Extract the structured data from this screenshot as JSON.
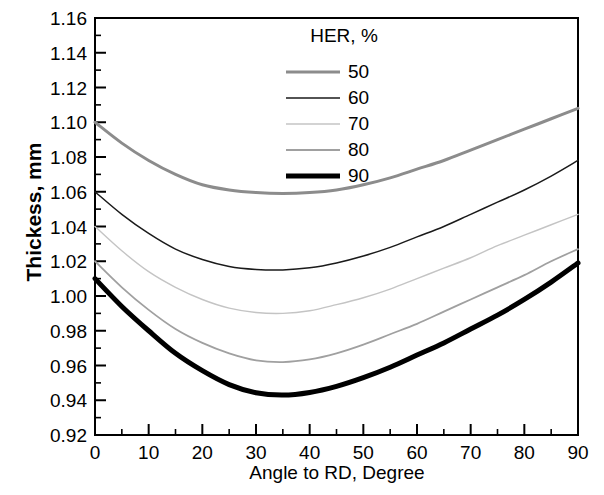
{
  "chart_data": {
    "type": "line",
    "title": "",
    "xlabel": "Angle to RD, Degree",
    "ylabel": "Thickess, mm",
    "xlim": [
      0,
      90
    ],
    "ylim": [
      0.92,
      1.16
    ],
    "xticks": [
      0,
      10,
      20,
      30,
      40,
      50,
      60,
      70,
      80,
      90
    ],
    "xtick_labels": [
      "0",
      "10",
      "20",
      "30",
      "40",
      "50",
      "60",
      "70",
      "80",
      "90"
    ],
    "xminor_step": 5,
    "yticks": [
      0.92,
      0.94,
      0.96,
      0.98,
      1.0,
      1.02,
      1.04,
      1.06,
      1.08,
      1.1,
      1.12,
      1.14,
      1.16
    ],
    "ytick_labels": [
      "0.92",
      "0.94",
      "0.96",
      "0.98",
      "1.00",
      "1.02",
      "1.04",
      "1.06",
      "1.08",
      "1.10",
      "1.12",
      "1.14",
      "1.16"
    ],
    "yminor_step": 0.01,
    "grid": false,
    "legend": {
      "title": "HER, %",
      "position": "top-center-right",
      "entries": [
        {
          "label": "50",
          "color": "#8c8c8c",
          "width": 3.0
        },
        {
          "label": "60",
          "color": "#1a1a1a",
          "width": 1.5
        },
        {
          "label": "70",
          "color": "#c4c4c4",
          "width": 1.4
        },
        {
          "label": "80",
          "color": "#a0a0a0",
          "width": 1.8
        },
        {
          "label": "90",
          "color": "#000000",
          "width": 5.0
        }
      ]
    },
    "x": [
      0,
      5,
      10,
      15,
      20,
      25,
      30,
      35,
      40,
      45,
      50,
      55,
      60,
      65,
      70,
      75,
      80,
      85,
      90
    ],
    "series": [
      {
        "name": "50",
        "color": "#8c8c8c",
        "width": 3.0,
        "min_value": 1.059,
        "min_at": 34,
        "values": [
          1.1,
          1.088,
          1.078,
          1.07,
          1.064,
          1.061,
          1.0595,
          1.059,
          1.0595,
          1.061,
          1.064,
          1.068,
          1.073,
          1.078,
          1.084,
          1.09,
          1.096,
          1.102,
          1.108
        ]
      },
      {
        "name": "60",
        "color": "#1a1a1a",
        "width": 1.5,
        "min_value": 1.015,
        "min_at": 33,
        "values": [
          1.06,
          1.047,
          1.036,
          1.027,
          1.021,
          1.017,
          1.0153,
          1.015,
          1.0162,
          1.019,
          1.023,
          1.028,
          1.034,
          1.04,
          1.047,
          1.054,
          1.061,
          1.069,
          1.078
        ]
      },
      {
        "name": "70",
        "color": "#c4c4c4",
        "width": 1.4,
        "min_value": 0.99,
        "min_at": 32,
        "values": [
          1.04,
          1.026,
          1.014,
          1.005,
          0.998,
          0.993,
          0.9905,
          0.99,
          0.9915,
          0.995,
          0.999,
          1.004,
          1.01,
          1.016,
          1.022,
          1.029,
          1.035,
          1.041,
          1.047
        ]
      },
      {
        "name": "80",
        "color": "#a0a0a0",
        "width": 1.8,
        "min_value": 0.962,
        "min_at": 31,
        "values": [
          1.02,
          1.005,
          0.992,
          0.981,
          0.973,
          0.967,
          0.963,
          0.962,
          0.9635,
          0.967,
          0.972,
          0.978,
          0.984,
          0.991,
          0.998,
          1.005,
          1.012,
          1.02,
          1.027
        ]
      },
      {
        "name": "90",
        "color": "#000000",
        "width": 5.0,
        "min_value": 0.943,
        "min_at": 32,
        "values": [
          1.01,
          0.994,
          0.98,
          0.967,
          0.957,
          0.949,
          0.9443,
          0.943,
          0.9445,
          0.948,
          0.953,
          0.959,
          0.966,
          0.973,
          0.981,
          0.989,
          0.998,
          1.008,
          1.019
        ]
      }
    ]
  },
  "axes": {
    "frame_color": "#000000"
  }
}
